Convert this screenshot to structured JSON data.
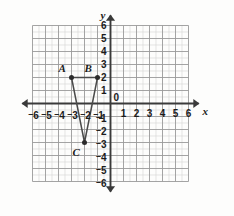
{
  "chart_data": {
    "type": "scatter",
    "title": "",
    "xlabel": "x",
    "ylabel": "y",
    "xlim": [
      -6,
      6
    ],
    "ylim": [
      -6,
      6
    ],
    "grid": true,
    "minor_grid": true,
    "minor_grid_step": 0.5,
    "legend": "none",
    "x_ticks": [
      "-6",
      "-5",
      "-4",
      "-3",
      "-2",
      "-1",
      "0",
      "1",
      "2",
      "3",
      "4",
      "5",
      "6"
    ],
    "y_ticks": [
      "6",
      "5",
      "4",
      "3",
      "2",
      "1",
      "0",
      "-1",
      "-2",
      "-3",
      "-4",
      "-5",
      "-6"
    ],
    "x_tick_labels": [
      {
        "value": -6,
        "sign": "-",
        "digit": "6"
      },
      {
        "value": -5,
        "sign": "-",
        "digit": "5"
      },
      {
        "value": -4,
        "sign": "-",
        "digit": "4"
      },
      {
        "value": -3,
        "sign": "-",
        "digit": "3"
      },
      {
        "value": -2,
        "sign": "-",
        "digit": "2"
      },
      {
        "value": -1,
        "sign": "-",
        "digit": "1"
      },
      {
        "value": 1,
        "sign": "",
        "digit": "1"
      },
      {
        "value": 2,
        "sign": "",
        "digit": "2"
      },
      {
        "value": 3,
        "sign": "",
        "digit": "3"
      },
      {
        "value": 4,
        "sign": "",
        "digit": "4"
      },
      {
        "value": 5,
        "sign": "",
        "digit": "5"
      },
      {
        "value": 6,
        "sign": "",
        "digit": "6"
      }
    ],
    "y_tick_labels": [
      {
        "value": 6,
        "sign": "",
        "digit": "6"
      },
      {
        "value": 5,
        "sign": "",
        "digit": "5"
      },
      {
        "value": 4,
        "sign": "",
        "digit": "4"
      },
      {
        "value": 3,
        "sign": "",
        "digit": "3"
      },
      {
        "value": 2,
        "sign": "",
        "digit": "2"
      },
      {
        "value": 1,
        "sign": "",
        "digit": "1"
      },
      {
        "value": -1,
        "sign": "-",
        "digit": "1"
      },
      {
        "value": -2,
        "sign": "-",
        "digit": "2"
      },
      {
        "value": -3,
        "sign": "-",
        "digit": "3"
      },
      {
        "value": -4,
        "sign": "-",
        "digit": "4"
      },
      {
        "value": -5,
        "sign": "-",
        "digit": "5"
      },
      {
        "value": -6,
        "sign": "-",
        "digit": "6"
      }
    ],
    "origin_label": "0",
    "points": [
      {
        "label": "A",
        "x": -3,
        "y": 2
      },
      {
        "label": "B",
        "x": -1,
        "y": 2
      },
      {
        "label": "C",
        "x": -2,
        "y": -3
      }
    ],
    "polygon": [
      "A",
      "B",
      "C"
    ],
    "colors": {
      "background": "#fdfdfc",
      "major_grid": "#9a9a9a",
      "minor_grid": "#d8d8d8",
      "axis": "#3a3a3a",
      "shape_stroke": "#4a4a4a",
      "point_fill": "#2b2b2b",
      "text": "#1b1b1b"
    }
  }
}
